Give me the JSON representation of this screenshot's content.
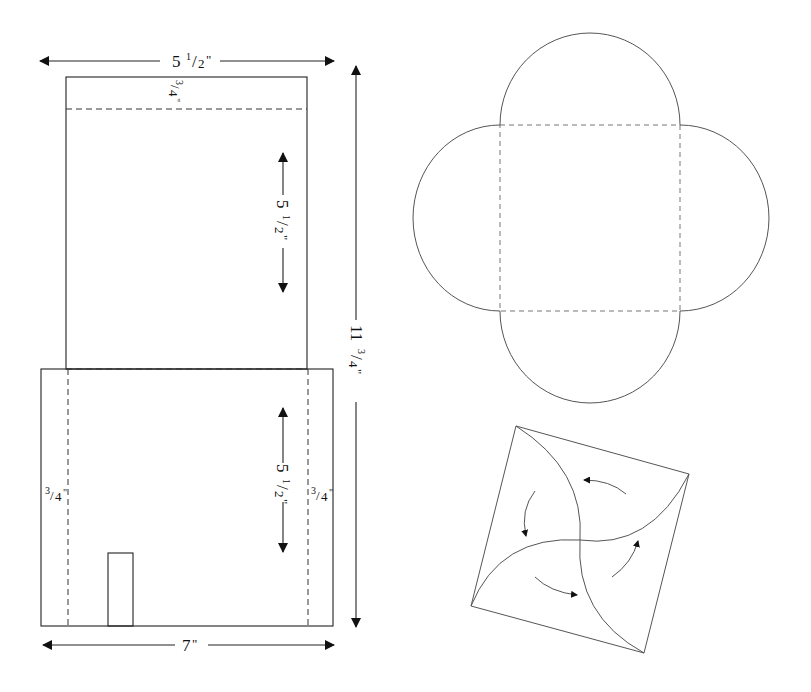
{
  "diagram": {
    "colors": {
      "stroke": "#222222",
      "background": "#ffffff"
    },
    "box_template": {
      "top_width": {
        "whole": "5",
        "num": "1",
        "den": "2",
        "unit": "\""
      },
      "top_flap": {
        "num": "3",
        "den": "4",
        "unit": "\""
      },
      "upper_panel_height": {
        "whole": "5",
        "num": "1",
        "den": "2",
        "unit": "\""
      },
      "lower_panel_height": {
        "whole": "5",
        "num": "1",
        "den": "2",
        "unit": "\""
      },
      "total_height": {
        "whole": "11",
        "num": "3",
        "den": "4",
        "unit": "\""
      },
      "left_flap": {
        "num": "3",
        "den": "4",
        "unit": "\""
      },
      "right_flap": {
        "num": "3",
        "den": "4",
        "unit": "\""
      },
      "bottom_width": {
        "whole": "7",
        "unit": "\""
      }
    },
    "flower_envelope": {
      "shape": "square with four semicircular flaps",
      "fold_lines": "dashed"
    },
    "pinwheel_fold": {
      "shape": "rotated square with four arc folds",
      "arrows": 4
    }
  }
}
